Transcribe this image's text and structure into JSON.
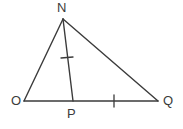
{
  "figure": {
    "type": "geometry-diagram",
    "width": 183,
    "height": 129,
    "background_color": "#ffffff",
    "stroke_color": "#3b3b3b",
    "label_color": "#3b3b3b",
    "stroke_width": 1.4,
    "points": [
      {
        "id": "N",
        "label": "N",
        "x": 63,
        "y": 19
      },
      {
        "id": "O",
        "label": "O",
        "x": 24,
        "y": 101
      },
      {
        "id": "P",
        "label": "P",
        "x": 73,
        "y": 101
      },
      {
        "id": "Q",
        "label": "Q",
        "x": 158,
        "y": 101
      }
    ],
    "segments": [
      {
        "id": "NO",
        "from": "N",
        "to": "O",
        "x1": 63,
        "y1": 19,
        "x2": 24,
        "y2": 101
      },
      {
        "id": "NP",
        "from": "N",
        "to": "P",
        "x1": 63,
        "y1": 19,
        "x2": 73,
        "y2": 101
      },
      {
        "id": "NQ",
        "from": "N",
        "to": "Q",
        "x1": 63,
        "y1": 19,
        "x2": 158,
        "y2": 101
      },
      {
        "id": "OQ",
        "from": "O",
        "to": "Q",
        "x1": 24,
        "y1": 101,
        "x2": 158,
        "y2": 101
      }
    ],
    "tick_marks": [
      {
        "id": "tick-NP",
        "on_segment": "NP",
        "count": 1,
        "x1": 61,
        "y1": 58,
        "x2": 73,
        "y2": 57
      },
      {
        "id": "tick-PQ",
        "on_segment": "PQ",
        "count": 1,
        "x1": 114,
        "y1": 95,
        "x2": 114,
        "y2": 107
      }
    ],
    "labels": {
      "N": "N",
      "O": "O",
      "P": "P",
      "Q": "Q"
    }
  }
}
